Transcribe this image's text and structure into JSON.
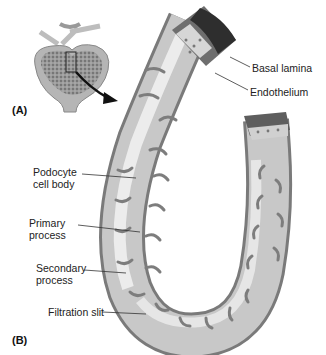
{
  "figure": {
    "panels": [
      {
        "id": "A",
        "label": "(A)",
        "description": "glomerulus overview with inset box and arrow"
      },
      {
        "id": "B",
        "label": "(B)",
        "description": "glomerular capillary wrapped by podocyte"
      }
    ],
    "labels": {
      "basal_lamina": "Basal lamina",
      "endothelium": "Endothelium",
      "podocyte_line1": "Podocyte",
      "podocyte_line2": "cell body",
      "primary_line1": "Primary",
      "primary_line2": "process",
      "secondary_line1": "Secondary",
      "secondary_line2": "process",
      "filtration_slit": "Filtration slit"
    },
    "colors": {
      "tube_light": "#e4e4e4",
      "tube_mid": "#b9b9b9",
      "tube_dark": "#7a7a7a",
      "lumen_dark": "#3a3a3a",
      "glomerulus": "#8c8c8c",
      "leader_line": "#333333"
    }
  }
}
